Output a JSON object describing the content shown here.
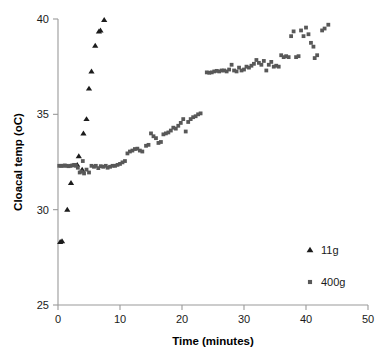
{
  "chart_data": {
    "type": "scatter",
    "title": "",
    "xlabel": "Time (minutes)",
    "ylabel": "Cloacal temp (oC)",
    "xlim": [
      0,
      50
    ],
    "ylim": [
      25,
      40
    ],
    "xticks": [
      0,
      10,
      20,
      30,
      40,
      50
    ],
    "yticks": [
      25,
      30,
      35,
      40
    ],
    "xtick_labels": [
      "0",
      "10",
      "20",
      "30",
      "40",
      "50"
    ],
    "ytick_labels": [
      "25",
      "30",
      "35",
      "40"
    ],
    "grid": false,
    "legend_position": "lower-right",
    "series": [
      {
        "name": "11g",
        "marker": "triangle",
        "color": "#1c1c1c",
        "points": [
          [
            0.35,
            28.3
          ],
          [
            0.65,
            28.35
          ],
          [
            1.5,
            30.0
          ],
          [
            2.1,
            31.4
          ],
          [
            3.1,
            32.35
          ],
          [
            3.35,
            32.8
          ],
          [
            3.9,
            32.1
          ],
          [
            4.1,
            34.0
          ],
          [
            4.6,
            34.75
          ],
          [
            5.0,
            36.35
          ],
          [
            5.4,
            37.25
          ],
          [
            6.0,
            38.6
          ],
          [
            6.6,
            39.35
          ],
          [
            6.85,
            39.4
          ],
          [
            7.45,
            39.95
          ]
        ]
      },
      {
        "name": "400g",
        "marker": "square",
        "color": "#585858",
        "points": [
          [
            0.2,
            32.3
          ],
          [
            0.5,
            32.3
          ],
          [
            0.8,
            32.3
          ],
          [
            1.1,
            32.32
          ],
          [
            1.4,
            32.3
          ],
          [
            1.7,
            32.28
          ],
          [
            2.0,
            32.3
          ],
          [
            2.3,
            32.32
          ],
          [
            2.6,
            32.35
          ],
          [
            2.9,
            32.3
          ],
          [
            3.2,
            32.2
          ],
          [
            3.5,
            31.95
          ],
          [
            3.8,
            32.0
          ],
          [
            4.0,
            32.55
          ],
          [
            4.2,
            31.9
          ],
          [
            4.6,
            32.1
          ],
          [
            5.0,
            31.95
          ],
          [
            5.4,
            32.3
          ],
          [
            5.8,
            32.25
          ],
          [
            6.1,
            32.3
          ],
          [
            6.5,
            32.18
          ],
          [
            6.9,
            32.28
          ],
          [
            7.3,
            32.25
          ],
          [
            7.7,
            32.3
          ],
          [
            8.0,
            32.2
          ],
          [
            8.4,
            32.25
          ],
          [
            8.8,
            32.3
          ],
          [
            9.2,
            32.3
          ],
          [
            9.6,
            32.35
          ],
          [
            10.0,
            32.4
          ],
          [
            10.4,
            32.48
          ],
          [
            10.8,
            32.55
          ],
          [
            11.2,
            32.95
          ],
          [
            11.6,
            33.05
          ],
          [
            12.0,
            33.1
          ],
          [
            12.4,
            33.18
          ],
          [
            12.8,
            33.2
          ],
          [
            13.2,
            33.1
          ],
          [
            13.6,
            33.05
          ],
          [
            14.2,
            33.35
          ],
          [
            14.6,
            33.4
          ],
          [
            15.0,
            34.0
          ],
          [
            15.4,
            33.85
          ],
          [
            15.8,
            33.75
          ],
          [
            16.2,
            33.5
          ],
          [
            16.6,
            33.55
          ],
          [
            17.0,
            33.95
          ],
          [
            17.4,
            34.0
          ],
          [
            17.8,
            34.05
          ],
          [
            18.2,
            34.15
          ],
          [
            18.6,
            34.3
          ],
          [
            19.0,
            34.25
          ],
          [
            19.4,
            34.4
          ],
          [
            19.8,
            34.55
          ],
          [
            20.2,
            34.75
          ],
          [
            20.6,
            34.1
          ],
          [
            21.0,
            34.6
          ],
          [
            21.4,
            34.75
          ],
          [
            21.8,
            34.85
          ],
          [
            22.2,
            34.9
          ],
          [
            22.6,
            35.0
          ],
          [
            23.0,
            35.05
          ],
          [
            24.0,
            37.2
          ],
          [
            24.4,
            37.18
          ],
          [
            24.8,
            37.2
          ],
          [
            25.2,
            37.25
          ],
          [
            25.6,
            37.28
          ],
          [
            26.0,
            37.25
          ],
          [
            26.4,
            37.3
          ],
          [
            26.8,
            37.3
          ],
          [
            27.2,
            37.25
          ],
          [
            27.6,
            37.35
          ],
          [
            28.0,
            37.6
          ],
          [
            28.4,
            37.3
          ],
          [
            28.8,
            37.25
          ],
          [
            29.2,
            37.45
          ],
          [
            29.6,
            37.3
          ],
          [
            30.0,
            37.35
          ],
          [
            30.4,
            37.5
          ],
          [
            30.8,
            37.45
          ],
          [
            31.2,
            37.55
          ],
          [
            31.6,
            37.65
          ],
          [
            32.0,
            37.85
          ],
          [
            32.4,
            37.7
          ],
          [
            32.8,
            37.6
          ],
          [
            33.2,
            37.8
          ],
          [
            33.6,
            37.3
          ],
          [
            34.0,
            37.6
          ],
          [
            34.4,
            37.75
          ],
          [
            34.8,
            37.5
          ],
          [
            35.2,
            37.55
          ],
          [
            35.6,
            37.5
          ],
          [
            36.0,
            38.1
          ],
          [
            36.4,
            38.0
          ],
          [
            36.8,
            38.05
          ],
          [
            37.2,
            38.0
          ],
          [
            37.6,
            39.1
          ],
          [
            38.0,
            39.35
          ],
          [
            38.4,
            38.0
          ],
          [
            38.8,
            38.05
          ],
          [
            39.2,
            39.4
          ],
          [
            39.6,
            39.1
          ],
          [
            40.0,
            39.55
          ],
          [
            40.4,
            39.2
          ],
          [
            40.8,
            38.75
          ],
          [
            41.2,
            38.55
          ],
          [
            41.4,
            37.95
          ],
          [
            41.8,
            38.1
          ],
          [
            42.6,
            39.4
          ],
          [
            43.0,
            39.5
          ],
          [
            43.6,
            39.7
          ]
        ]
      }
    ]
  },
  "legend": {
    "entries": [
      {
        "label": "11g",
        "marker": "triangle-marker-icon"
      },
      {
        "label": "400g",
        "marker": "square-marker-icon"
      }
    ]
  },
  "colors": {
    "triangle_series": "#1c1c1c",
    "square_series": "#585858",
    "axis": "#9a9a9a",
    "text": "#1a1a1a",
    "background": "#ffffff"
  }
}
